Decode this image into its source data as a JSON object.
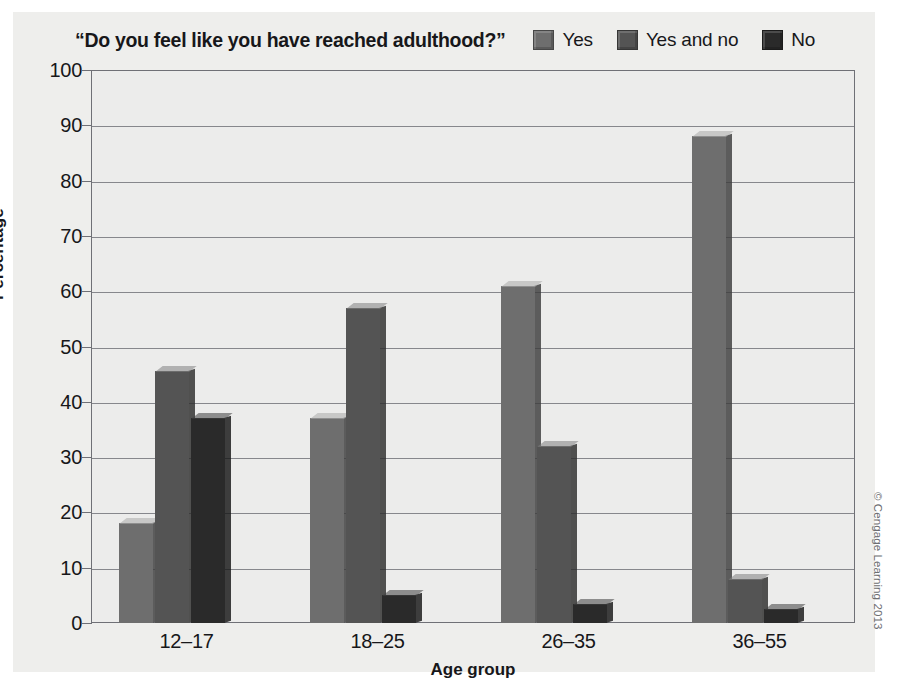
{
  "figure": {
    "credit": "© Cengage Learning 2013",
    "background_color": "#eeeeec",
    "plot_background_color": "#ececeb",
    "frame_color": "#6f7076"
  },
  "legend": {
    "position": "top-right",
    "items": [
      {
        "label": "Yes",
        "color": "#6e6e6e"
      },
      {
        "label": "Yes and no",
        "color": "#545454"
      },
      {
        "label": "No",
        "color": "#2a2a2a"
      }
    ]
  },
  "chart_data": {
    "type": "bar",
    "title": "“Do you feel like you have reached adulthood?”",
    "subtitle": "",
    "xlabel": "Age group",
    "ylabel": "Percentage",
    "categories": [
      "12–17",
      "18–25",
      "26–35",
      "36–55"
    ],
    "series": [
      {
        "name": "Yes",
        "color": "#6e6e6e",
        "values": [
          18,
          37,
          61,
          88
        ]
      },
      {
        "name": "Yes and no",
        "color": "#545454",
        "values": [
          45.5,
          57,
          32,
          8
        ]
      },
      {
        "name": "No",
        "color": "#2a2a2a",
        "values": [
          37,
          5,
          3.5,
          2.5
        ]
      }
    ],
    "ylim": [
      0,
      100
    ],
    "ytick_step": 10,
    "yticks": [
      0,
      10,
      20,
      30,
      40,
      50,
      60,
      70,
      80,
      90,
      100
    ],
    "ytick_labels": [
      "0",
      "10",
      "20",
      "30",
      "40",
      "50",
      "60",
      "70",
      "80",
      "90",
      "100"
    ],
    "grid": true,
    "grid_axis": "y",
    "legend_position": "top-right",
    "bar_style": "3d-shaded"
  }
}
